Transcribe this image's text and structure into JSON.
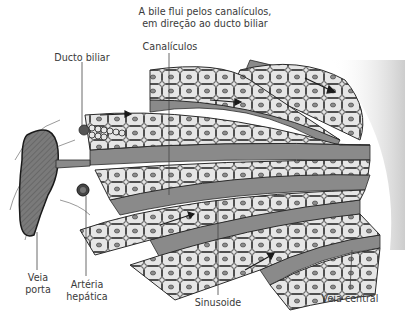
{
  "diagram": {
    "type": "anatomical-illustration",
    "colors": {
      "background": "#ffffff",
      "hepatocyte_fill": "#e6e6e6",
      "sinusoid_fill": "#8a8a8a",
      "outline": "#2a2a2a",
      "nucleus": "#8c8c8c",
      "portal_vein_fill": "#7a7a7a",
      "label_text": "#3a3a3a"
    },
    "labels": {
      "bile_flow_line1": "A bile flui pelos canalículos,",
      "bile_flow_line2": "em direção ao ducto biliar",
      "canaliculi": "Canalículos",
      "bile_duct": "Ducto biliar",
      "portal_vein_line1": "Veia",
      "portal_vein_line2": "porta",
      "hepatic_artery_line1": "Artéria",
      "hepatic_artery_line2": "hepática",
      "sinusoid": "Sinusoide",
      "central_vein": "Veia central"
    }
  }
}
